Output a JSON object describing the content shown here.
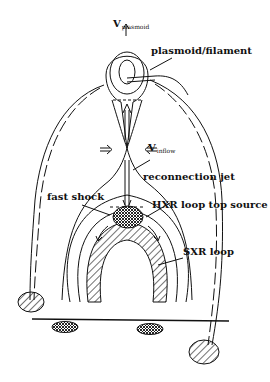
{
  "figure": {
    "type": "solar flare magnetic reconnection model",
    "labels": {
      "v_plasmoid_main": "V",
      "v_plasmoid_sub": "plasmoid",
      "plasmoid": "plasmoid/filament",
      "v_inflow_main": "V",
      "v_inflow_sub": "inflow",
      "reconnection_jet": "reconnection jet",
      "fast_shock": "fast shock",
      "hxr_source": "HXR loop top source",
      "sxr_loop": "SXR loop"
    },
    "colors": {
      "ink": "#111111",
      "background": "#ffffff"
    }
  }
}
